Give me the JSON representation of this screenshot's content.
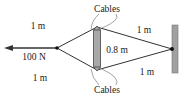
{
  "diagram": {
    "force": {
      "label": "100 N"
    },
    "cables": {
      "top_label": "Cables",
      "bottom_label": "Cables",
      "segments": [
        {
          "id": "top-left",
          "label": "1 m"
        },
        {
          "id": "bottom-left",
          "label": "1 m"
        },
        {
          "id": "top-right",
          "label": "1 m"
        },
        {
          "id": "bottom-right",
          "label": "1 m"
        }
      ]
    },
    "strut": {
      "label": "0.8 m"
    },
    "colors": {
      "line": "#333333",
      "strut_fill": "#a8a8a8",
      "wall_fill": "#a0a0a0",
      "node": "#111111"
    }
  }
}
